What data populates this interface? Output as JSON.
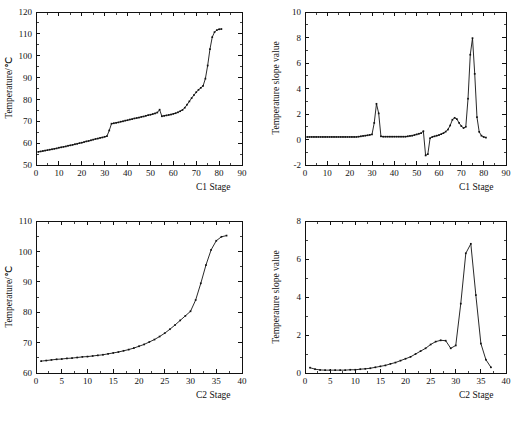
{
  "figure": {
    "title": "",
    "caption": "",
    "background": "#ffffff",
    "ink": "#111111"
  },
  "chart_data": [
    {
      "panel": "top-left",
      "type": "line",
      "title": "",
      "xlabel": "C1 Stage",
      "ylabel": "Temperature/℃",
      "xlim": [
        0,
        90
      ],
      "ylim": [
        50,
        120
      ],
      "xticks": [
        0,
        10,
        20,
        30,
        40,
        50,
        60,
        70,
        80,
        90
      ],
      "yticks": [
        50,
        60,
        70,
        80,
        90,
        100,
        110,
        120
      ],
      "xtick_step": 10,
      "ytick_step": 10,
      "grid": false,
      "legend": "none",
      "marker": "square",
      "x": [
        1,
        2,
        3,
        4,
        5,
        6,
        7,
        8,
        9,
        10,
        11,
        12,
        13,
        14,
        15,
        16,
        17,
        18,
        19,
        20,
        21,
        22,
        23,
        24,
        25,
        26,
        27,
        28,
        29,
        30,
        31,
        32,
        33,
        34,
        35,
        36,
        37,
        38,
        39,
        40,
        41,
        42,
        43,
        44,
        45,
        46,
        47,
        48,
        49,
        50,
        51,
        52,
        53,
        54,
        55,
        56,
        57,
        58,
        59,
        60,
        61,
        62,
        63,
        64,
        65,
        66,
        67,
        68,
        69,
        70,
        71,
        72,
        73,
        74,
        75,
        76,
        77,
        78,
        79,
        80,
        81
      ],
      "y": [
        56.0,
        56.2,
        56.4,
        56.6,
        56.8,
        57.0,
        57.2,
        57.4,
        57.6,
        57.9,
        58.1,
        58.3,
        58.5,
        58.8,
        59.0,
        59.2,
        59.5,
        59.7,
        60.0,
        60.2,
        60.5,
        60.8,
        61.0,
        61.3,
        61.6,
        61.9,
        62.1,
        62.4,
        62.6,
        62.9,
        63.2,
        65.8,
        68.9,
        69.1,
        69.3,
        69.5,
        69.8,
        70.0,
        70.3,
        70.5,
        70.8,
        71.0,
        71.3,
        71.5,
        71.7,
        72.0,
        72.2,
        72.5,
        72.8,
        73.0,
        73.3,
        73.6,
        74.0,
        75.3,
        72.3,
        72.5,
        72.7,
        72.9,
        73.1,
        73.4,
        73.7,
        74.1,
        74.6,
        75.2,
        76.2,
        77.6,
        79.1,
        80.6,
        82.0,
        83.3,
        84.4,
        85.3,
        86.2,
        89.5,
        95.5,
        103.0,
        108.5,
        110.8,
        111.7,
        112.1,
        112.2
      ]
    },
    {
      "panel": "top-right",
      "type": "line",
      "title": "",
      "xlabel": "C1 Stage",
      "ylabel": "Temperature slope value",
      "xlim": [
        0,
        90
      ],
      "ylim": [
        -2,
        10
      ],
      "xticks": [
        0,
        10,
        20,
        30,
        40,
        50,
        60,
        70,
        80,
        90
      ],
      "yticks": [
        -2,
        0,
        2,
        4,
        6,
        8,
        10
      ],
      "xtick_step": 10,
      "ytick_step": 2,
      "grid": false,
      "legend": "none",
      "marker": "square",
      "x": [
        1,
        2,
        3,
        4,
        5,
        6,
        7,
        8,
        9,
        10,
        11,
        12,
        13,
        14,
        15,
        16,
        17,
        18,
        19,
        20,
        21,
        22,
        23,
        24,
        25,
        26,
        27,
        28,
        29,
        30,
        31,
        32,
        33,
        34,
        35,
        36,
        37,
        38,
        39,
        40,
        41,
        42,
        43,
        44,
        45,
        46,
        47,
        48,
        49,
        50,
        51,
        52,
        53,
        54,
        55,
        56,
        57,
        58,
        59,
        60,
        61,
        62,
        63,
        64,
        65,
        66,
        67,
        68,
        69,
        70,
        71,
        72,
        73,
        74,
        75,
        76,
        77,
        78,
        79,
        80,
        81
      ],
      "y": [
        0.2,
        0.2,
        0.2,
        0.2,
        0.2,
        0.2,
        0.2,
        0.2,
        0.2,
        0.2,
        0.2,
        0.2,
        0.2,
        0.2,
        0.2,
        0.2,
        0.2,
        0.2,
        0.2,
        0.2,
        0.2,
        0.2,
        0.2,
        0.22,
        0.25,
        0.28,
        0.3,
        0.33,
        0.36,
        0.4,
        1.3,
        2.8,
        2.05,
        0.25,
        0.22,
        0.22,
        0.22,
        0.22,
        0.22,
        0.22,
        0.22,
        0.22,
        0.22,
        0.22,
        0.22,
        0.25,
        0.28,
        0.3,
        0.35,
        0.4,
        0.45,
        0.5,
        0.65,
        -1.25,
        -1.15,
        0.1,
        0.2,
        0.25,
        0.3,
        0.35,
        0.42,
        0.5,
        0.62,
        0.78,
        1.1,
        1.55,
        1.7,
        1.6,
        1.3,
        1.05,
        0.9,
        1.0,
        3.2,
        6.65,
        7.95,
        5.15,
        1.75,
        0.6,
        0.3,
        0.2,
        0.15
      ]
    },
    {
      "panel": "bottom-left",
      "type": "line",
      "title": "",
      "xlabel": "C2 Stage",
      "ylabel": "Temperature/℃",
      "xlim": [
        0,
        40
      ],
      "ylim": [
        60,
        110
      ],
      "xticks": [
        0,
        5,
        10,
        15,
        20,
        25,
        30,
        35,
        40
      ],
      "yticks": [
        60,
        70,
        80,
        90,
        100,
        110
      ],
      "xtick_step": 5,
      "ytick_step": 10,
      "grid": false,
      "legend": "none",
      "marker": "square",
      "x": [
        1,
        2,
        3,
        4,
        5,
        6,
        7,
        8,
        9,
        10,
        11,
        12,
        13,
        14,
        15,
        16,
        17,
        18,
        19,
        20,
        21,
        22,
        23,
        24,
        25,
        26,
        27,
        28,
        29,
        30,
        31,
        32,
        33,
        34,
        35,
        36,
        37
      ],
      "y": [
        63.9,
        64.1,
        64.3,
        64.5,
        64.6,
        64.8,
        64.9,
        65.1,
        65.3,
        65.4,
        65.6,
        65.8,
        66.0,
        66.3,
        66.6,
        66.9,
        67.3,
        67.7,
        68.2,
        68.8,
        69.4,
        70.2,
        71.0,
        72.0,
        73.1,
        74.4,
        75.8,
        77.3,
        78.8,
        80.3,
        84.0,
        89.5,
        95.5,
        100.5,
        103.5,
        104.8,
        105.2
      ]
    },
    {
      "panel": "bottom-right",
      "type": "line",
      "title": "",
      "xlabel": "C2 Stage",
      "ylabel": "Temperature slope value",
      "xlim": [
        0,
        40
      ],
      "ylim": [
        0,
        8
      ],
      "xticks": [
        0,
        5,
        10,
        15,
        20,
        25,
        30,
        35,
        40
      ],
      "yticks": [
        0,
        2,
        4,
        6,
        8
      ],
      "xtick_step": 5,
      "ytick_step": 2,
      "grid": false,
      "legend": "none",
      "marker": "square",
      "x": [
        1,
        2,
        3,
        4,
        5,
        6,
        7,
        8,
        9,
        10,
        11,
        12,
        13,
        14,
        15,
        16,
        17,
        18,
        19,
        20,
        21,
        22,
        23,
        24,
        25,
        26,
        27,
        28,
        29,
        30,
        31,
        32,
        33,
        34,
        35,
        36,
        37
      ],
      "y": [
        0.28,
        0.2,
        0.16,
        0.15,
        0.15,
        0.15,
        0.15,
        0.15,
        0.17,
        0.17,
        0.2,
        0.22,
        0.25,
        0.3,
        0.35,
        0.4,
        0.48,
        0.55,
        0.65,
        0.75,
        0.85,
        1.0,
        1.15,
        1.3,
        1.5,
        1.65,
        1.72,
        1.7,
        1.3,
        1.45,
        3.65,
        6.3,
        6.8,
        4.1,
        1.55,
        0.7,
        0.3
      ]
    }
  ]
}
